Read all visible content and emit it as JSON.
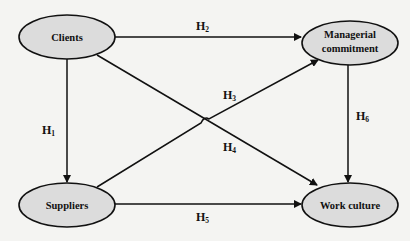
{
  "diagram": {
    "nodes": {
      "clients": {
        "label_lines": [
          "Clients"
        ]
      },
      "managerial": {
        "label_lines": [
          "Managerial",
          "commitment"
        ]
      },
      "suppliers": {
        "label_lines": [
          "Suppliers"
        ]
      },
      "work_culture": {
        "label_lines": [
          "Work culture"
        ]
      }
    },
    "edges": [
      {
        "id": "H1",
        "from": "Clients",
        "to": "Suppliers",
        "label": "H",
        "sub": "1"
      },
      {
        "id": "H2",
        "from": "Clients",
        "to": "Managerial commitment",
        "label": "H",
        "sub": "2"
      },
      {
        "id": "H3",
        "from": "Suppliers",
        "to": "Managerial commitment",
        "label": "H",
        "sub": "3"
      },
      {
        "id": "H4",
        "from": "Clients",
        "to": "Work culture",
        "label": "H",
        "sub": "4"
      },
      {
        "id": "H5",
        "from": "Suppliers",
        "to": "Work culture",
        "label": "H",
        "sub": "5"
      },
      {
        "id": "H6",
        "from": "Managerial commitment",
        "to": "Work culture",
        "label": "H",
        "sub": "6"
      }
    ]
  }
}
